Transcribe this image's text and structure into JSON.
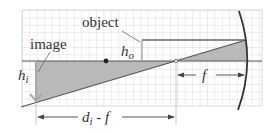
{
  "diagram": {
    "labels": {
      "object": "object",
      "image": "image",
      "h_o_main": "h",
      "h_o_sub": "o",
      "h_i_main": "h",
      "h_i_sub": "i",
      "f": "f",
      "di_minus_f_main": "d",
      "di_minus_f_sub": "i",
      "di_minus_f_rest": " - f"
    },
    "colors": {
      "grid": "#cfcfcf",
      "line": "#555555",
      "shade": "#b8b8b8",
      "mirror": "#333333",
      "arrow": "#a0a0a0"
    }
  }
}
